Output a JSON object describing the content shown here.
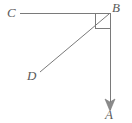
{
  "figure": {
    "kind": "geometry-diagram",
    "canvas": {
      "width": 132,
      "height": 123,
      "background": "#ffffff"
    },
    "style": {
      "stroke_color": "#7a7a7a",
      "stroke_width": 1,
      "label_color": "#5a5a5a",
      "label_font_size": 13
    },
    "points": [
      {
        "id": "B",
        "label": "B",
        "x": 110,
        "y": 13,
        "role": "vertex"
      },
      {
        "id": "C",
        "label": "C",
        "x": 20,
        "y": 13,
        "role": "ray-endpoint"
      },
      {
        "id": "D",
        "label": "D",
        "x": 40,
        "y": 72,
        "role": "segment-endpoint"
      },
      {
        "id": "A",
        "label": "A",
        "x": 110,
        "y": 110,
        "role": "ray-endpoint"
      }
    ],
    "segments": [
      {
        "id": "BC",
        "from": "B",
        "to": "C",
        "arrow": false,
        "name": "ray-bc"
      },
      {
        "id": "BA",
        "from": "B",
        "to": "A",
        "arrow": true,
        "name": "ray-ba"
      },
      {
        "id": "BD",
        "from": "B",
        "to": "D",
        "arrow": false,
        "name": "segment-bd"
      }
    ],
    "right_angle_marker": {
      "at": "B",
      "size": 15,
      "x": 95,
      "y": 13,
      "name": "right-angle-marker"
    },
    "arrowhead": {
      "on": "BA",
      "tip_x": 110,
      "tip_y": 110,
      "half_width": 5,
      "length": 11,
      "name": "arrowhead-a"
    },
    "labels": {
      "A": "A",
      "B": "B",
      "C": "C",
      "D": "D"
    }
  }
}
